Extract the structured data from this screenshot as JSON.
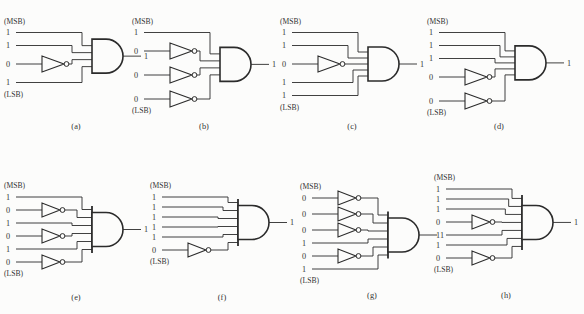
{
  "figure": {
    "background": "#fcfcfb",
    "line_color": "#2b2b2b",
    "text_color": "#333333"
  },
  "circuits": [
    {
      "label": "(a)",
      "msb": "(MSB)",
      "lsb": "(LSB)",
      "gate": "AND",
      "output": "1",
      "inputs": [
        {
          "value": "1",
          "inverted": false
        },
        {
          "value": "1",
          "inverted": false
        },
        {
          "value": "0",
          "inverted": true
        },
        {
          "value": "1",
          "inverted": false
        }
      ]
    },
    {
      "label": "(b)",
      "msb": "(MSB)",
      "lsb": "(LSB)",
      "gate": "AND",
      "output": "1",
      "inputs": [
        {
          "value": "1",
          "inverted": false
        },
        {
          "value": "0",
          "inverted": true
        },
        {
          "value": "0",
          "inverted": true
        },
        {
          "value": "0",
          "inverted": true
        }
      ]
    },
    {
      "label": "(c)",
      "msb": "(MSB)",
      "lsb": "(LSB)",
      "gate": "AND",
      "output": "1",
      "inputs": [
        {
          "value": "1",
          "inverted": false
        },
        {
          "value": "1",
          "inverted": false
        },
        {
          "value": "0",
          "inverted": true
        },
        {
          "value": "1",
          "inverted": false
        },
        {
          "value": "1",
          "inverted": false
        }
      ]
    },
    {
      "label": "(d)",
      "msb": "(MSB)",
      "lsb": "(LSB)",
      "gate": "AND",
      "output": "1",
      "inputs": [
        {
          "value": "1",
          "inverted": false
        },
        {
          "value": "1",
          "inverted": false
        },
        {
          "value": "1",
          "inverted": false
        },
        {
          "value": "0",
          "inverted": true
        },
        {
          "value": "0",
          "inverted": true
        }
      ]
    },
    {
      "label": "(e)",
      "msb": "(MSB)",
      "lsb": "(LSB)",
      "gate": "AND",
      "output": "1",
      "inputs": [
        {
          "value": "1",
          "inverted": false
        },
        {
          "value": "0",
          "inverted": true
        },
        {
          "value": "1",
          "inverted": false
        },
        {
          "value": "0",
          "inverted": true
        },
        {
          "value": "1",
          "inverted": false
        },
        {
          "value": "0",
          "inverted": true
        }
      ]
    },
    {
      "label": "(f)",
      "msb": "(MSB)",
      "lsb": "(LSB)",
      "gate": "AND",
      "output": "1",
      "inputs": [
        {
          "value": "1",
          "inverted": false
        },
        {
          "value": "1",
          "inverted": false
        },
        {
          "value": "1",
          "inverted": false
        },
        {
          "value": "1",
          "inverted": false
        },
        {
          "value": "1",
          "inverted": false
        },
        {
          "value": "0",
          "inverted": true
        }
      ]
    },
    {
      "label": "(g)",
      "msb": "(MSB)",
      "lsb": "(LSB)",
      "gate": "AND",
      "output": "1",
      "inputs": [
        {
          "value": "0",
          "inverted": true
        },
        {
          "value": "0",
          "inverted": true
        },
        {
          "value": "0",
          "inverted": true
        },
        {
          "value": "1",
          "inverted": false
        },
        {
          "value": "0",
          "inverted": true
        },
        {
          "value": "1",
          "inverted": false
        }
      ]
    },
    {
      "label": "(h)",
      "msb": "(MSB)",
      "lsb": "(LSB)",
      "gate": "AND",
      "output": "1",
      "inputs": [
        {
          "value": "1",
          "inverted": false
        },
        {
          "value": "1",
          "inverted": false
        },
        {
          "value": "1",
          "inverted": false
        },
        {
          "value": "0",
          "inverted": true
        },
        {
          "value": "1",
          "inverted": false
        },
        {
          "value": "1",
          "inverted": false
        },
        {
          "value": "0",
          "inverted": true
        }
      ]
    }
  ],
  "layout_positions": [
    {
      "x": 2,
      "y": 0,
      "row": "top"
    },
    {
      "x": 130,
      "y": 0,
      "row": "top"
    },
    {
      "x": 278,
      "y": 0,
      "row": "top"
    },
    {
      "x": 425,
      "y": 0,
      "row": "top"
    },
    {
      "x": 2,
      "y": 152,
      "row": "bottom"
    },
    {
      "x": 148,
      "y": 152,
      "row": "bottom"
    },
    {
      "x": 298,
      "y": 150,
      "row": "bottom"
    },
    {
      "x": 432,
      "y": 150,
      "row": "bottom"
    }
  ]
}
